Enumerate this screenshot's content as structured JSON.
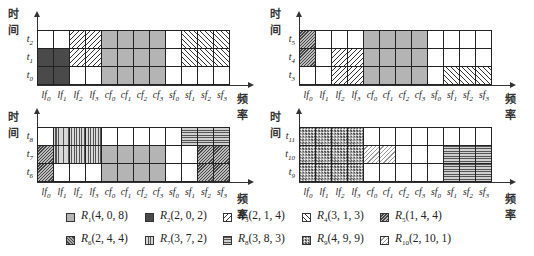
{
  "axis": {
    "y_label": "时间",
    "x_label": "频率"
  },
  "columns": [
    "lf0",
    "lf1",
    "lf2",
    "lf3",
    "cf0",
    "cf1",
    "cf2",
    "cf3",
    "sf0",
    "sf1",
    "sf2",
    "sf3"
  ],
  "column_labels": [
    {
      "base": "lf",
      "sub": "0"
    },
    {
      "base": "lf",
      "sub": "1"
    },
    {
      "base": "lf",
      "sub": "2"
    },
    {
      "base": "lf",
      "sub": "3"
    },
    {
      "base": "cf",
      "sub": "0"
    },
    {
      "base": "cf",
      "sub": "1"
    },
    {
      "base": "cf",
      "sub": "2"
    },
    {
      "base": "cf",
      "sub": "3"
    },
    {
      "base": "sf",
      "sub": "0"
    },
    {
      "base": "sf",
      "sub": "1"
    },
    {
      "base": "sf",
      "sub": "2"
    },
    {
      "base": "sf",
      "sub": "3"
    }
  ],
  "panels": [
    {
      "id": "top-left",
      "rows": [
        {
          "label": "t",
          "sub": "2",
          "cells": [
            "white",
            "white",
            "R3",
            "R3",
            "R1",
            "R1",
            "R1",
            "R1",
            "white",
            "R4",
            "R4",
            "R4"
          ]
        },
        {
          "label": "t",
          "sub": "1",
          "cells": [
            "R2",
            "R2",
            "R3",
            "R3",
            "R1",
            "R1",
            "R1",
            "R1",
            "white",
            "R4",
            "R4",
            "R4"
          ]
        },
        {
          "label": "t",
          "sub": "0",
          "cells": [
            "R2",
            "R2",
            "white",
            "white",
            "R1",
            "R1",
            "R1",
            "R1",
            "white",
            "white",
            "white",
            "white"
          ]
        }
      ]
    },
    {
      "id": "top-right",
      "rows": [
        {
          "label": "t",
          "sub": "5",
          "cells": [
            "R5",
            "white",
            "white",
            "white",
            "R1",
            "R1",
            "R1",
            "R1",
            "white",
            "white",
            "white",
            "white"
          ]
        },
        {
          "label": "t",
          "sub": "4",
          "cells": [
            "R5",
            "white",
            "R3",
            "R3",
            "R1",
            "R1",
            "R1",
            "R1",
            "white",
            "white",
            "white",
            "white"
          ]
        },
        {
          "label": "t",
          "sub": "3",
          "cells": [
            "white",
            "white",
            "R3",
            "R3",
            "R1",
            "R1",
            "R1",
            "R1",
            "white",
            "R4",
            "R4",
            "R4"
          ]
        }
      ]
    },
    {
      "id": "bottom-left",
      "rows": [
        {
          "label": "t",
          "sub": "8",
          "cells": [
            "white",
            "R7",
            "R7",
            "R7",
            "white",
            "white",
            "white",
            "white",
            "white",
            "R8",
            "R8",
            "R8"
          ]
        },
        {
          "label": "t",
          "sub": "7",
          "cells": [
            "R5",
            "R7",
            "R7",
            "R7",
            "R1",
            "R1",
            "R1",
            "R1",
            "white",
            "white",
            "R5",
            "R5"
          ]
        },
        {
          "label": "t",
          "sub": "6",
          "cells": [
            "R5",
            "white",
            "white",
            "white",
            "R1",
            "R1",
            "R1",
            "R1",
            "white",
            "white",
            "R5",
            "R5"
          ]
        }
      ]
    },
    {
      "id": "bottom-right",
      "rows": [
        {
          "label": "t",
          "sub": "11",
          "cells": [
            "R9",
            "R9",
            "R9",
            "R9",
            "white",
            "white",
            "white",
            "white",
            "white",
            "white",
            "white",
            "white"
          ]
        },
        {
          "label": "t",
          "sub": "10",
          "cells": [
            "R9",
            "R9",
            "R9",
            "R9",
            "R10",
            "R10",
            "white",
            "white",
            "white",
            "R8",
            "R8",
            "R8"
          ]
        },
        {
          "label": "t",
          "sub": "9",
          "cells": [
            "R9",
            "R9",
            "R9",
            "R9",
            "white",
            "white",
            "white",
            "white",
            "white",
            "R8",
            "R8",
            "R8"
          ]
        }
      ]
    }
  ],
  "legend": [
    {
      "id": "R1",
      "name": "R",
      "sub": "1",
      "params": "(4, 0, 8)"
    },
    {
      "id": "R2",
      "name": "R",
      "sub": "2",
      "params": "(2, 0, 2)"
    },
    {
      "id": "R3",
      "name": "R",
      "sub": "3",
      "params": "(2, 1, 4)"
    },
    {
      "id": "R4",
      "name": "R",
      "sub": "4",
      "params": "(3, 1, 3)"
    },
    {
      "id": "R5",
      "name": "R",
      "sub": "5",
      "params": "(1, 4, 4)"
    },
    {
      "id": "R6",
      "name": "R",
      "sub": "6",
      "params": "(2, 4, 4)"
    },
    {
      "id": "R7",
      "name": "R",
      "sub": "7",
      "params": "(3, 7, 2)"
    },
    {
      "id": "R8",
      "name": "R",
      "sub": "8",
      "params": "(3, 8, 3)"
    },
    {
      "id": "R9",
      "name": "R",
      "sub": "9",
      "params": "(4, 9, 9)"
    },
    {
      "id": "R10",
      "name": "R",
      "sub": "10",
      "params": "(2, 10, 1)"
    }
  ]
}
